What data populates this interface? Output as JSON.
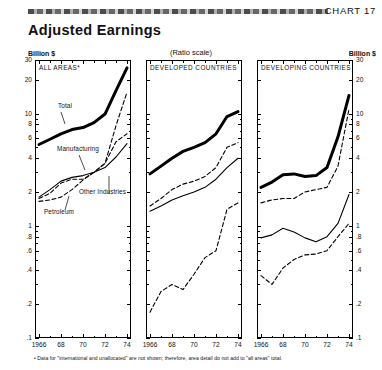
{
  "header": {
    "chart_number": "CHART 17",
    "title": "Adjusted Earnings",
    "ratio_scale_note": "(Ratio scale)",
    "unit_left": "Billion $",
    "unit_right": "Billion $"
  },
  "footnote": "• Data for \"international and unallocated\" are not shown; therefore, area detail do not add to \"all areas\" total.",
  "annotations": {
    "total": "Total",
    "manufacturing": "Manufacturing",
    "other_industries": "Other Industries",
    "petroleum": "Petroleum"
  },
  "chart_data": [
    {
      "type": "line",
      "title": "ALL AREAS*",
      "panel": 1,
      "xlabel": "",
      "ylabel": "Billion $",
      "scale": "log",
      "ylim": [
        0.1,
        30
      ],
      "yticks": [
        30,
        20,
        10,
        8,
        6,
        4,
        2,
        1,
        0.8,
        0.6,
        0.4,
        0.2,
        0.1
      ],
      "ytick_labels": [
        "30",
        "20",
        "10",
        "8",
        "6",
        "4",
        "2",
        "1",
        ".8",
        ".6",
        ".4",
        ".2",
        ".1"
      ],
      "x": [
        1966,
        1967,
        1968,
        1969,
        1970,
        1971,
        1972,
        1973,
        1974
      ],
      "xticks": [
        1966,
        1968,
        1970,
        1972,
        1974
      ],
      "xtick_labels": [
        "1966",
        "68",
        "70",
        "72",
        "74"
      ],
      "series": [
        {
          "name": "Total",
          "style": "solid-thick",
          "values": [
            5.3,
            5.9,
            6.6,
            7.2,
            7.5,
            8.3,
            9.9,
            16.0,
            25.5
          ]
        },
        {
          "name": "Manufacturing",
          "style": "dashed",
          "values": [
            1.75,
            1.95,
            2.4,
            2.6,
            2.6,
            3.0,
            3.6,
            7.8,
            15.5
          ]
        },
        {
          "name": "Other Industries",
          "style": "solid-thin",
          "values": [
            1.8,
            2.1,
            2.5,
            2.7,
            2.8,
            3.0,
            3.3,
            4.1,
            5.4
          ]
        },
        {
          "name": "Petroleum",
          "style": "dashed",
          "values": [
            1.65,
            1.7,
            1.8,
            2.1,
            2.55,
            3.0,
            3.6,
            5.6,
            6.6
          ]
        }
      ]
    },
    {
      "type": "line",
      "title": "DEVELOPED COUNTRIES",
      "panel": 2,
      "xlabel": "",
      "scale": "log",
      "ylim": [
        0.1,
        30
      ],
      "yticks": [
        30,
        20,
        10,
        8,
        6,
        4,
        2,
        1,
        0.8,
        0.6,
        0.4,
        0.2,
        0.1
      ],
      "x": [
        1966,
        1967,
        1968,
        1969,
        1970,
        1971,
        1972,
        1973,
        1974
      ],
      "xticks": [
        1966,
        1968,
        1970,
        1972,
        1974
      ],
      "xtick_labels": [
        "1966",
        "68",
        "70",
        "72",
        "74"
      ],
      "series": [
        {
          "name": "Total",
          "style": "solid-thick",
          "values": [
            2.9,
            3.4,
            4.0,
            4.6,
            5.0,
            5.5,
            6.6,
            9.4,
            10.4
          ]
        },
        {
          "name": "Manufacturing",
          "style": "dashed",
          "values": [
            1.5,
            1.75,
            2.1,
            2.35,
            2.5,
            2.75,
            3.3,
            5.0,
            5.5
          ]
        },
        {
          "name": "Other Industries",
          "style": "solid-thin",
          "values": [
            1.35,
            1.5,
            1.7,
            1.85,
            2.0,
            2.2,
            2.6,
            3.3,
            4.0
          ]
        },
        {
          "name": "Petroleum",
          "style": "dashed",
          "values": [
            0.17,
            0.26,
            0.3,
            0.27,
            0.37,
            0.52,
            0.6,
            1.4,
            1.6
          ]
        }
      ]
    },
    {
      "type": "line",
      "title": "DEVELOPING COUNTRIES",
      "panel": 3,
      "xlabel": "",
      "ylabel": "Billion $",
      "scale": "log",
      "ylim": [
        0.1,
        30
      ],
      "yticks": [
        30,
        20,
        10,
        8,
        6,
        4,
        2,
        1,
        0.8,
        0.6,
        0.4,
        0.2,
        0.1
      ],
      "ytick_labels": [
        "30",
        "20",
        "10",
        "8",
        "6",
        "4",
        "2",
        "1",
        ".8",
        ".6",
        ".4",
        ".2",
        ".1"
      ],
      "x": [
        1966,
        1967,
        1968,
        1969,
        1970,
        1971,
        1972,
        1973,
        1974
      ],
      "xticks": [
        1966,
        1968,
        1970,
        1972,
        1974
      ],
      "xtick_labels": [
        "1966",
        "68",
        "70",
        "72",
        "74"
      ],
      "series": [
        {
          "name": "Total",
          "style": "solid-thick",
          "values": [
            2.2,
            2.45,
            2.85,
            2.9,
            2.75,
            2.8,
            3.3,
            6.2,
            14.5
          ]
        },
        {
          "name": "Petroleum",
          "style": "dashed",
          "values": [
            1.6,
            1.7,
            1.75,
            1.75,
            2.0,
            2.1,
            2.2,
            3.4,
            11.0
          ]
        },
        {
          "name": "Other Industries",
          "style": "solid-thin",
          "values": [
            0.78,
            0.83,
            0.95,
            0.88,
            0.78,
            0.72,
            0.8,
            1.05,
            1.9
          ]
        },
        {
          "name": "Manufacturing",
          "style": "dashed",
          "values": [
            0.36,
            0.3,
            0.42,
            0.5,
            0.55,
            0.56,
            0.6,
            0.8,
            1.05
          ]
        }
      ]
    }
  ]
}
